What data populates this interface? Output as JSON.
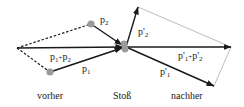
{
  "diagram": {
    "title": "",
    "captions": {
      "before": "vorher",
      "collision": "Stoß",
      "after": "nachher"
    },
    "before": {
      "vectors": [
        {
          "id": "p2",
          "label_base": "p",
          "label_sub": "2",
          "from": [
            91,
            24
          ],
          "to": [
            124,
            47
          ]
        },
        {
          "id": "p1",
          "label_base": "p",
          "label_sub": "1",
          "from": [
            50,
            72
          ],
          "to": [
            124,
            47
          ]
        },
        {
          "id": "p1_plus_p2",
          "label_base": "p",
          "label_sub": "1",
          "label_op": "+",
          "label_base2": "p",
          "label_sub2": "2",
          "from": [
            17,
            48
          ],
          "to": [
            124,
            47
          ]
        }
      ],
      "dashed_lines": [
        {
          "from": [
            17,
            48
          ],
          "to": [
            91,
            24
          ]
        },
        {
          "from": [
            17,
            48
          ],
          "to": [
            50,
            72
          ]
        }
      ],
      "particles": [
        {
          "id": "particle-2",
          "at": [
            91,
            24
          ],
          "color": "#999999"
        },
        {
          "id": "particle-1",
          "at": [
            50,
            72
          ],
          "color": "#999999"
        }
      ]
    },
    "after": {
      "vectors": [
        {
          "id": "p2_prime",
          "label_base": "p'",
          "label_sub": "2",
          "from": [
            126,
            47
          ],
          "to": [
            138,
            7
          ]
        },
        {
          "id": "p1_prime",
          "label_base": "p'",
          "label_sub": "1",
          "from": [
            126,
            47
          ],
          "to": [
            214,
            86
          ]
        },
        {
          "id": "p1p_plus_p2p",
          "label_base": "p'",
          "label_sub": "1",
          "label_op": "+",
          "label_base2": "p'",
          "label_sub2": "2",
          "from": [
            126,
            47
          ],
          "to": [
            231,
            47
          ]
        }
      ],
      "thin_lines": [
        {
          "from": [
            138,
            7
          ],
          "to": [
            231,
            47
          ]
        },
        {
          "from": [
            214,
            86
          ],
          "to": [
            231,
            47
          ]
        }
      ],
      "particles": [
        {
          "id": "collision-particles",
          "at": [
            125,
            46
          ],
          "color": "#999999"
        }
      ]
    },
    "labels": {
      "p2": {
        "base": "p",
        "sub": "2"
      },
      "p1": {
        "base": "p",
        "sub": "1"
      },
      "p1p2_a": {
        "base": "p",
        "sub": "1"
      },
      "p1p2_op": "+",
      "p1p2_b": {
        "base": "p",
        "sub": "2"
      },
      "p2p": {
        "base": "p'",
        "sub": "2"
      },
      "p1p": {
        "base": "p'",
        "sub": "1"
      },
      "p1pp2p_a": {
        "base": "p'",
        "sub": "1"
      },
      "p1pp2p_op": "+",
      "p1pp2p_b": {
        "base": "p'",
        "sub": "2"
      }
    },
    "colors": {
      "vector": "#1a1a1a",
      "particle": "#9a9a9a",
      "thin_line": "#a0a0a0"
    }
  }
}
